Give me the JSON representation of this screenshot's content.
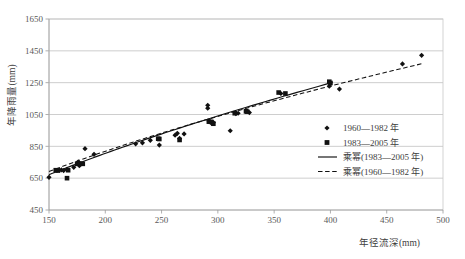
{
  "chart_data": {
    "type": "scatter",
    "title": "",
    "xlabel": "年径流深(mm)",
    "ylabel": "年降雨量(mm)",
    "xlim": [
      150,
      500
    ],
    "ylim": [
      450,
      1650
    ],
    "xticks": [
      150,
      200,
      250,
      300,
      350,
      400,
      450,
      500
    ],
    "yticks": [
      450,
      650,
      850,
      1050,
      1250,
      1450,
      1650
    ],
    "grid": "horizontal",
    "legend_position": "right-middle",
    "series": [
      {
        "name": "1960—1982 年",
        "marker": "diamond",
        "color": "#111111",
        "points": [
          [
            150,
            655
          ],
          [
            159,
            700
          ],
          [
            161,
            702
          ],
          [
            163,
            698
          ],
          [
            166,
            705
          ],
          [
            172,
            718
          ],
          [
            176,
            752
          ],
          [
            177,
            728
          ],
          [
            182,
            835
          ],
          [
            190,
            800
          ],
          [
            227,
            866
          ],
          [
            233,
            872
          ],
          [
            240,
            888
          ],
          [
            248,
            858
          ],
          [
            262,
            920
          ],
          [
            264,
            932
          ],
          [
            266,
            900
          ],
          [
            270,
            928
          ],
          [
            291,
            1090
          ],
          [
            291,
            1108
          ],
          [
            292,
            1010
          ],
          [
            294,
            998
          ],
          [
            296,
            1000
          ],
          [
            311,
            948
          ],
          [
            316,
            1056
          ],
          [
            318,
            1058
          ],
          [
            328,
            1062
          ],
          [
            356,
            1182
          ],
          [
            399,
            1228
          ],
          [
            408,
            1210
          ],
          [
            464,
            1368
          ],
          [
            481,
            1422
          ]
        ]
      },
      {
        "name": "1983—2005 年",
        "marker": "square",
        "color": "#111111",
        "points": [
          [
            156,
            700
          ],
          [
            158,
            698
          ],
          [
            166,
            650
          ],
          [
            167,
            700
          ],
          [
            175,
            740
          ],
          [
            177,
            742
          ],
          [
            180,
            740
          ],
          [
            247,
            898
          ],
          [
            248,
            896
          ],
          [
            266,
            890
          ],
          [
            292,
            1005
          ],
          [
            294,
            1004
          ],
          [
            296,
            992
          ],
          [
            315,
            1058
          ],
          [
            325,
            1070
          ],
          [
            326,
            1068
          ],
          [
            354,
            1188
          ],
          [
            360,
            1182
          ],
          [
            399,
            1256
          ],
          [
            400,
            1248
          ]
        ]
      }
    ],
    "fits": [
      {
        "name": "乘幂(1983—2005 年)",
        "style": "solid",
        "color": "#111111",
        "x_start": 150,
        "x_end": 402,
        "y_start": 672,
        "y_end": 1252
      },
      {
        "name": "乘幂(1960—1982 年)",
        "style": "dashed",
        "color": "#111111",
        "x_start": 150,
        "x_end": 483,
        "y_start": 692,
        "y_end": 1372
      }
    ],
    "legend_entries": [
      {
        "label": "1960—1982 年",
        "type": "marker",
        "marker": "diamond"
      },
      {
        "label": "1983—2005 年",
        "type": "marker",
        "marker": "square"
      },
      {
        "label": "乘幂(1983—2005 年)",
        "type": "line",
        "style": "solid"
      },
      {
        "label": "乘幂(1960—1982 年)",
        "type": "line",
        "style": "dashed"
      }
    ]
  },
  "axis": {
    "x_tick_labels": [
      "150",
      "200",
      "250",
      "300",
      "350",
      "400",
      "450",
      "500"
    ],
    "y_tick_labels": [
      "450",
      "650",
      "850",
      "1050",
      "1250",
      "1450",
      "1650"
    ],
    "x_title": "年径流深(mm)",
    "y_title": "年降雨量(mm)"
  }
}
